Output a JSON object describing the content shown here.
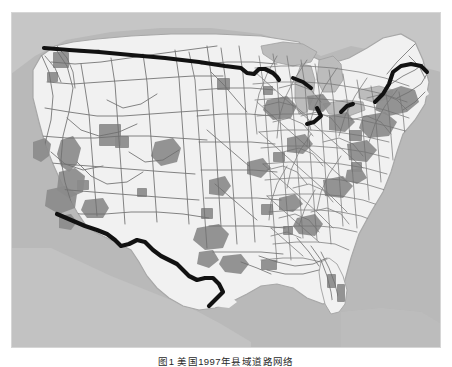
{
  "figure": {
    "caption": "图1  美国1997年县域道路网络",
    "alt_title": "Map of the contiguous United States road network"
  },
  "map": {
    "title": "United States road network with urbanized areas",
    "region": "Contiguous United States",
    "colors": {
      "ocean": "#b9b9b9",
      "land": "#f1f1f1",
      "land_outside_us": "#c9c9c9",
      "urban_area": "#8c8c8c",
      "road": "#6f6f6f",
      "border_highlight": "#111111",
      "lake": "#bdbdbd",
      "frame_bg": "#ffffff"
    },
    "legend_items": [
      {
        "name": "national-border",
        "label": "国界（加粗）",
        "color": "#111111"
      },
      {
        "name": "road-network",
        "label": "道路网",
        "color": "#6f6f6f"
      },
      {
        "name": "urbanized-area",
        "label": "城市化地区",
        "color": "#8c8c8c"
      },
      {
        "name": "land",
        "label": "陆地",
        "color": "#f1f1f1"
      },
      {
        "name": "water",
        "label": "水域",
        "color": "#b9b9b9"
      }
    ],
    "features": {
      "great_lakes": [
        "Superior",
        "Michigan",
        "Huron",
        "Erie",
        "Ontario"
      ],
      "highlighted_borders": [
        "Canada–US northern border",
        "Mexico–US southern border",
        "Great Lakes border segments"
      ],
      "dense_network_regions": [
        "Midwest",
        "Northeast",
        "Ohio Valley",
        "Southeast Piedmont"
      ],
      "sparse_network_regions": [
        "Great Basin",
        "Northern Rockies",
        "West Texas"
      ]
    },
    "urban_clusters": [
      "Seattle",
      "Portland",
      "San Francisco Bay Area",
      "Central Valley",
      "Los Angeles",
      "San Diego",
      "Las Vegas",
      "Phoenix",
      "Salt Lake City",
      "Denver",
      "Dallas–Fort Worth",
      "Houston",
      "San Antonio",
      "New Orleans",
      "Atlanta",
      "Miami",
      "Tampa",
      "Chicago",
      "Detroit",
      "Cleveland",
      "Pittsburgh",
      "New York",
      "Philadelphia",
      "Boston",
      "Washington DC",
      "Minneapolis",
      "St. Louis",
      "Kansas City",
      "Oklahoma City",
      "Memphis",
      "Nashville",
      "Charlotte",
      "Norfolk"
    ]
  }
}
